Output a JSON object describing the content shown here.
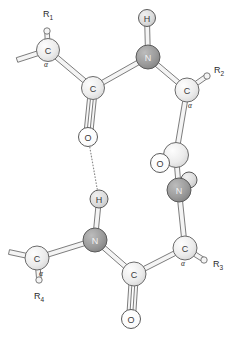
{
  "figure": {
    "type": "molecular-structure-diagram",
    "background_color": "#ffffff",
    "bond_stroke_color": "#6e6e6e",
    "bond_fill_color": "#f4f4f4",
    "hbond_color": "#8a8a8a"
  },
  "palette": {
    "carbon_fill": "#e6e6e6",
    "carbon_stroke": "#6b6b6b",
    "nitrogen_fill": "#9a9a9a",
    "nitrogen_stroke": "#5a5a5a",
    "oxygen_fill": "#ffffff",
    "oxygen_stroke": "#5a5a5a",
    "hydrogen_fill": "#d8d8d8",
    "hydrogen_stroke": "#5a5a5a"
  },
  "atoms": [
    {
      "id": "ca1",
      "element": "C",
      "label": "C",
      "sub": "α",
      "x": 48,
      "y": 50,
      "r": 11.5,
      "kind": "carbon",
      "sub_dx": -2,
      "sub_dy": 14
    },
    {
      "id": "c1",
      "element": "C",
      "label": "C",
      "sub": "",
      "x": 93,
      "y": 88,
      "r": 11.5,
      "kind": "carbon",
      "sub_dx": 0,
      "sub_dy": 0
    },
    {
      "id": "o1",
      "element": "O",
      "label": "O",
      "sub": "",
      "x": 88,
      "y": 137,
      "r": 9.5,
      "kind": "oxygen",
      "sub_dx": 0,
      "sub_dy": 0
    },
    {
      "id": "n1",
      "element": "N",
      "label": "N",
      "sub": "",
      "x": 148,
      "y": 57,
      "r": 12.0,
      "kind": "nitrogen",
      "sub_dx": 0,
      "sub_dy": 0
    },
    {
      "id": "h1",
      "element": "H",
      "label": "H",
      "sub": "",
      "x": 147,
      "y": 18,
      "r": 8.5,
      "kind": "hydrogen",
      "sub_dx": 0,
      "sub_dy": 0
    },
    {
      "id": "ca2",
      "element": "C",
      "label": "C",
      "sub": "α",
      "x": 187,
      "y": 90,
      "r": 12.0,
      "kind": "carbon",
      "sub_dx": 3,
      "sub_dy": 15
    },
    {
      "id": "c2",
      "element": "C",
      "label": "",
      "sub": "",
      "x": 176,
      "y": 155,
      "r": 12.5,
      "kind": "carbon",
      "sub_dx": 0,
      "sub_dy": 0
    },
    {
      "id": "o2",
      "element": "O",
      "label": "O",
      "sub": "",
      "x": 160,
      "y": 163,
      "r": 9.5,
      "kind": "oxygen",
      "sub_dx": 0,
      "sub_dy": 0
    },
    {
      "id": "h2",
      "element": "H",
      "label": "",
      "sub": "",
      "x": 189,
      "y": 180,
      "r": 8.0,
      "kind": "hydrogen",
      "sub_dx": 0,
      "sub_dy": 0
    },
    {
      "id": "n2",
      "element": "N",
      "label": "N",
      "sub": "",
      "x": 179,
      "y": 190,
      "r": 12.0,
      "kind": "nitrogen",
      "sub_dx": 0,
      "sub_dy": 0
    },
    {
      "id": "ca3",
      "element": "C",
      "label": "C",
      "sub": "α",
      "x": 185,
      "y": 248,
      "r": 12.0,
      "kind": "carbon",
      "sub_dx": -2,
      "sub_dy": 15
    },
    {
      "id": "c3",
      "element": "C",
      "label": "C",
      "sub": "",
      "x": 134,
      "y": 274,
      "r": 12.0,
      "kind": "carbon",
      "sub_dx": 0,
      "sub_dy": 0
    },
    {
      "id": "o3",
      "element": "O",
      "label": "O",
      "sub": "",
      "x": 131,
      "y": 319,
      "r": 9.5,
      "kind": "oxygen",
      "sub_dx": 0,
      "sub_dy": 0
    },
    {
      "id": "n3",
      "element": "N",
      "label": "N",
      "sub": "",
      "x": 95,
      "y": 240,
      "r": 12.0,
      "kind": "nitrogen",
      "sub_dx": 0,
      "sub_dy": 0
    },
    {
      "id": "h3",
      "element": "H",
      "label": "H",
      "sub": "",
      "x": 99,
      "y": 199,
      "r": 9.0,
      "kind": "hydrogen",
      "sub_dx": 0,
      "sub_dy": 0
    },
    {
      "id": "ca4",
      "element": "C",
      "label": "C",
      "sub": "α",
      "x": 37,
      "y": 258,
      "r": 12.0,
      "kind": "carbon",
      "sub_dx": 4,
      "sub_dy": 15
    }
  ],
  "bonds": [
    {
      "from": "ca1",
      "to": "c1",
      "order": 1
    },
    {
      "from": "c1",
      "to": "n1",
      "order": 1
    },
    {
      "from": "c1",
      "to": "o1",
      "order": 2
    },
    {
      "from": "n1",
      "to": "h1",
      "order": 1
    },
    {
      "from": "n1",
      "to": "ca2",
      "order": 1
    },
    {
      "from": "ca2",
      "to": "c2",
      "order": 1
    },
    {
      "from": "c2",
      "to": "o2",
      "order": 2
    },
    {
      "from": "c2",
      "to": "n2",
      "order": 1
    },
    {
      "from": "n2",
      "to": "h2",
      "order": 1
    },
    {
      "from": "n2",
      "to": "ca3",
      "order": 1
    },
    {
      "from": "ca3",
      "to": "c3",
      "order": 1
    },
    {
      "from": "c3",
      "to": "o3",
      "order": 2
    },
    {
      "from": "c3",
      "to": "n3",
      "order": 1
    },
    {
      "from": "n3",
      "to": "h3",
      "order": 1
    },
    {
      "from": "n3",
      "to": "ca4",
      "order": 1
    }
  ],
  "hydrogen_bond": {
    "from": "o1",
    "to": "h3",
    "style": "dotted",
    "label": ""
  },
  "substituents": [
    {
      "id": "r1",
      "text": "R",
      "subscript": "1",
      "atom": "ca1",
      "stub_x": 47,
      "stub_y": 31,
      "label_x": 48,
      "label_y": 14,
      "tip_r": 3.2
    },
    {
      "id": "r2",
      "text": "R",
      "subscript": "2",
      "atom": "ca2",
      "stub_x": 207,
      "stub_y": 76,
      "label_x": 219,
      "label_y": 70,
      "tip_r": 3.2
    },
    {
      "id": "r3",
      "text": "R",
      "subscript": "3",
      "atom": "ca3",
      "stub_x": 204,
      "stub_y": 260,
      "label_x": 218,
      "label_y": 264,
      "tip_r": 3.2
    },
    {
      "id": "r4",
      "text": "R",
      "subscript": "4",
      "atom": "ca4",
      "stub_x": 39,
      "stub_y": 280,
      "label_x": 39,
      "label_y": 296,
      "tip_r": 3.2
    }
  ],
  "open_stubs": [
    {
      "id": "stub-ca1",
      "atom": "ca1",
      "end_x": 17,
      "end_y": 60
    },
    {
      "id": "stub-ca4",
      "atom": "ca4",
      "end_x": 9,
      "end_y": 252
    }
  ],
  "alpha_marks": [
    {
      "atom": "ca1",
      "text": "α"
    },
    {
      "atom": "ca2",
      "text": "α"
    },
    {
      "atom": "ca3",
      "text": "α"
    },
    {
      "atom": "ca4",
      "text": "α"
    }
  ]
}
